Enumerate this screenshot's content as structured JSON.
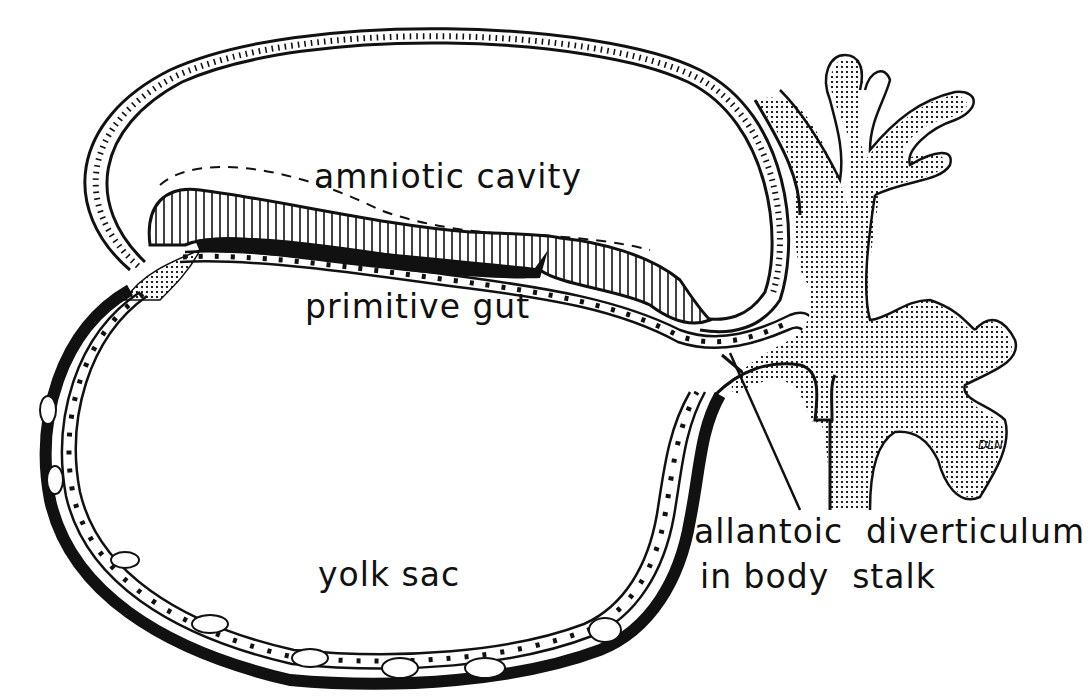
{
  "figure": {
    "type": "embryology cross-section line drawing",
    "colors": {
      "ink": "#111111",
      "background": "#ffffff",
      "stipple": "#111111"
    }
  },
  "labels": {
    "amniotic_cavity": "amniotic cavity",
    "primitive_gut": "primitive gut",
    "yolk_sac": "yolk sac",
    "allantoic_line1": "allantoic  diverticulum",
    "allantoic_line2": "in body  stalk"
  },
  "signature": "DLN"
}
